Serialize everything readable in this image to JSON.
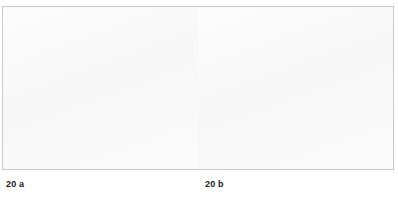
{
  "figure": {
    "number": "20",
    "panels": [
      {
        "id": "a",
        "caption": "20 a",
        "view": "frontal-skull-mixed-dentition",
        "description": "Anterior view of a child's skull with bone windowed open to show erupted deciduous teeth and unerupted permanent tooth germs in maxilla and mandible"
      },
      {
        "id": "b",
        "caption": "20 b",
        "view": "lateral-skull-mixed-dentition",
        "description": "Right lateral view of the same skull with the buccal cortical plate removed to show developing permanent tooth crowns within the alveolar bone"
      }
    ]
  },
  "colors": {
    "bone_fill": "#f5f4f1",
    "bone_outline": "#6f6f6f",
    "shadow_gray": "#b9b9b9",
    "cavity_gray": "#9a9a9a",
    "tooth_fill": "#fbfbfa",
    "frame_border": "#c9c9c9",
    "caption_text": "#161616",
    "page_background": "#ffffff"
  },
  "labels": {
    "panel_a_caption": "20 a",
    "panel_b_caption": "20 b"
  }
}
